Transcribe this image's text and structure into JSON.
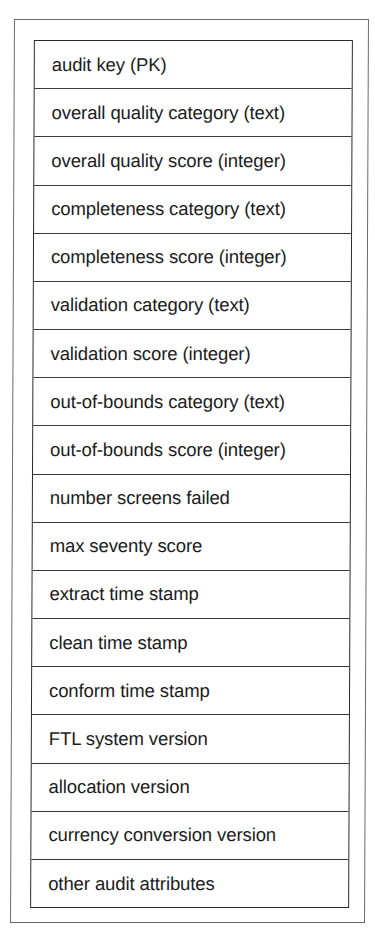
{
  "table": {
    "rows": [
      {
        "label": "audit key (PK)"
      },
      {
        "label": "overall quality category (text)"
      },
      {
        "label": "overall quality score (integer)"
      },
      {
        "label": "completeness category (text)"
      },
      {
        "label": "completeness score (integer)"
      },
      {
        "label": "validation category (text)"
      },
      {
        "label": "validation score (integer)"
      },
      {
        "label": "out-of-bounds category (text)"
      },
      {
        "label": "out-of-bounds score (integer)"
      },
      {
        "label": "number screens failed"
      },
      {
        "label": "max seventy score"
      },
      {
        "label": "extract time stamp"
      },
      {
        "label": "clean time stamp"
      },
      {
        "label": "conform time stamp"
      },
      {
        "label": "FTL system version"
      },
      {
        "label": "allocation version"
      },
      {
        "label": "currency conversion version"
      },
      {
        "label": "other audit attributes"
      }
    ]
  },
  "colors": {
    "border": "#2a2a2a",
    "frame": "#6a6a6a",
    "text": "#1c1c1c",
    "background": "#ffffff"
  }
}
